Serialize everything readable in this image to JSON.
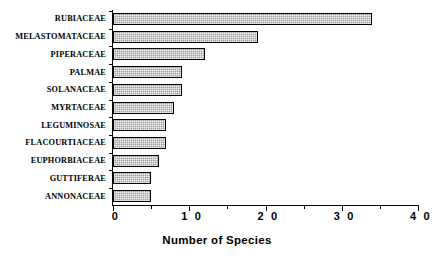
{
  "chart_data": {
    "type": "bar",
    "orientation": "horizontal",
    "title": "",
    "subtitle": "",
    "xlabel": "Number of Species",
    "ylabel": "",
    "xlim": [
      0,
      40
    ],
    "x_major_ticks": [
      0,
      10,
      20,
      30,
      40
    ],
    "x_minor_ticks": [
      5,
      15,
      25,
      35
    ],
    "x_tick_labels": [
      "0",
      "1 0",
      "2 0",
      "3 0",
      "4 0"
    ],
    "grid": false,
    "legend": false,
    "bar_fill_color": "#9a9a9a",
    "bar_edge_color": "#000000",
    "background_color": "#ffffff",
    "categories": [
      "RUBIACEAE",
      "MELASTOMATACEAE",
      "PIPERACEAE",
      "PALMAE",
      "SOLANACEAE",
      "MYRTACEAE",
      "LEGUMINOSAE",
      "FLACOURTIACEAE",
      "EUPHORBIACEAE",
      "GUTTIFERAE",
      "ANNONACEAE"
    ],
    "values": [
      34,
      19,
      12,
      9,
      9,
      8,
      7,
      7,
      6,
      5,
      5
    ]
  }
}
